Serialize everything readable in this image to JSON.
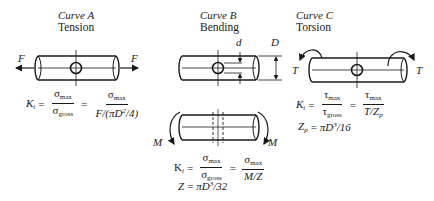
{
  "panels": [
    {
      "id": "A",
      "title": "Curve A",
      "subtitle": "Tension",
      "load_label_left": "F",
      "load_label_right": "F",
      "equation": {
        "lhs": "K",
        "lhs_sub": "t",
        "lhs_subsub": "g",
        "frac1_num": "σ",
        "frac1_num_sub": "max",
        "frac1_den": "σ",
        "frac1_den_sub": "gross",
        "frac2_num": "σ",
        "frac2_num_sub": "max",
        "frac2_den_a": "F/(πD",
        "frac2_den_sup": "2",
        "frac2_den_b": "/4)"
      }
    },
    {
      "id": "B",
      "title": "Curve B",
      "subtitle": "Bending",
      "hole_label": "d",
      "diameter_label": "D",
      "moment_label_left": "M",
      "moment_label_right": "M",
      "equation": {
        "lhs": "K",
        "lhs_sub": "t",
        "lhs_subsub": "g",
        "frac1_num": "σ",
        "frac1_num_sub": "max",
        "frac1_den": "σ",
        "frac1_den_sub": "gross",
        "frac2_num": "σ",
        "frac2_num_sub": "max",
        "frac2_den": "M/Z"
      },
      "modulus": {
        "lhs": "Z",
        "rhs_a": "πD",
        "rhs_sup": "3",
        "rhs_b": "/32"
      }
    },
    {
      "id": "C",
      "title": "Curve C",
      "subtitle": "Torsion",
      "torque_label_left": "T",
      "torque_label_right": "T",
      "equation": {
        "lhs": "K",
        "lhs_sub": "t",
        "lhs_subsub": "g",
        "frac1_num": "τ",
        "frac1_num_sub": "max",
        "frac1_den": "τ",
        "frac1_den_sub": "gross",
        "frac2_num": "τ",
        "frac2_num_sub": "max",
        "frac2_den_a": "T/Z",
        "frac2_den_sub": "p"
      },
      "modulus": {
        "lhs": "Z",
        "lhs_sub": "p",
        "rhs_a": "πD",
        "rhs_sup": "3",
        "rhs_b": "/16"
      }
    }
  ],
  "equals": "="
}
